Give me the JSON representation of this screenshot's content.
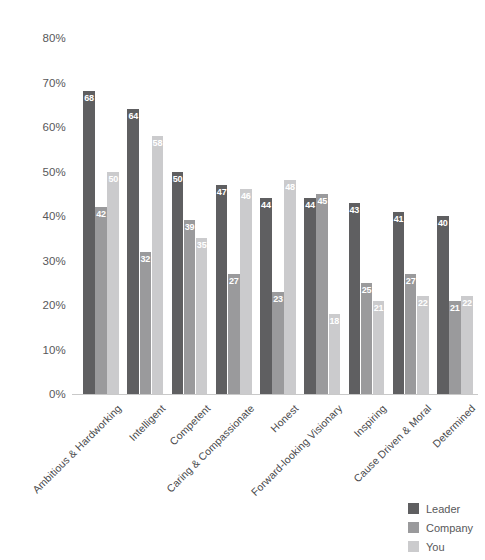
{
  "chart_data": {
    "type": "bar",
    "title": "",
    "xlabel": "",
    "ylabel": "",
    "ylim": [
      0,
      80
    ],
    "grid": false,
    "legend_position": "bottom-right",
    "ytick_labels": [
      "80%",
      "70%",
      "60%",
      "50%",
      "40%",
      "30%",
      "20%",
      "10%",
      "0%"
    ],
    "ytick_values": [
      80,
      70,
      60,
      50,
      40,
      30,
      20,
      10,
      0
    ],
    "categories": [
      "Ambitious & Hardworking",
      "Intelligent",
      "Competent",
      "Caring & Compassionate",
      "Honest",
      "Forward-looking Visionary",
      "Inspiring",
      "Cause Driven & Moral",
      "Determined"
    ],
    "series": [
      {
        "name": "Leader",
        "color": "#5f5f61",
        "values": [
          68,
          64,
          50,
          47,
          44,
          44,
          43,
          41,
          40
        ]
      },
      {
        "name": "Company",
        "color": "#9a9a9c",
        "values": [
          42,
          32,
          39,
          27,
          23,
          45,
          25,
          27,
          21
        ]
      },
      {
        "name": "You",
        "color": "#cbcbcd",
        "values": [
          50,
          58,
          35,
          46,
          48,
          18,
          21,
          22,
          22
        ]
      }
    ]
  },
  "legend": {
    "items": [
      {
        "label": "Leader",
        "color": "#5f5f61"
      },
      {
        "label": "Company",
        "color": "#9a9a9c"
      },
      {
        "label": "You",
        "color": "#cbcbcd"
      }
    ]
  }
}
